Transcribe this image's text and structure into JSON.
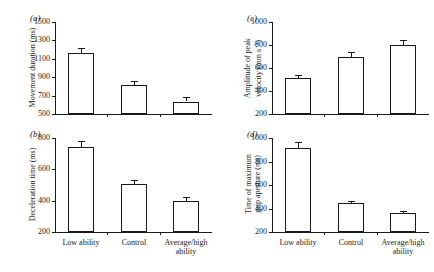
{
  "figure": {
    "background_color": "#ffffff",
    "line_color": "#1a1a1a",
    "bar_fill_color": "#ffffff"
  },
  "categories": [
    "Low ability",
    "Control",
    "Average/high ability"
  ],
  "category_labels": {
    "low": "Low ability",
    "control": "Control",
    "avg_high_line1": "Average/high",
    "avg_high_line2": "ability"
  },
  "panels": {
    "a": {
      "letter": "(a)",
      "ylabel": "Movement duration (ms)",
      "yticks": [
        "1500",
        "1300",
        "1100",
        "900",
        "700",
        "500"
      ]
    },
    "b": {
      "letter": "(b)",
      "ylabel": "Deceleration time (ms)",
      "yticks": [
        "800",
        "600",
        "400",
        "200"
      ]
    },
    "c": {
      "letter": "(c)",
      "ylabel_line1": "Amplitude of peak",
      "ylabel_line2": "velocity (mm s",
      "ylabel_sup": "−1",
      "ylabel_close": ")",
      "yticks": [
        "1000",
        "800",
        "600",
        "400",
        "200"
      ]
    },
    "d": {
      "letter": "(d)",
      "ylabel_line1": "Time of maximum",
      "ylabel_line2": "grip aperture (ms)",
      "yticks": [
        "1000",
        "800",
        "600",
        "400",
        "200"
      ]
    }
  },
  "chart_data": [
    {
      "type": "bar",
      "panel": "a",
      "title": "(a) Movement duration",
      "xlabel": "",
      "ylabel": "Movement duration (ms)",
      "categories": [
        "Low ability",
        "Control",
        "Average/high ability"
      ],
      "values": [
        1160,
        815,
        635
      ],
      "errors": [
        55,
        45,
        45
      ],
      "ylim": [
        500,
        1500
      ],
      "ytick_values": [
        500,
        700,
        900,
        1100,
        1300,
        1500
      ],
      "grid": false,
      "legend": "none"
    },
    {
      "type": "bar",
      "panel": "b",
      "title": "(b) Deceleration time",
      "xlabel": "",
      "ylabel": "Deceleration time (ms)",
      "categories": [
        "Low ability",
        "Control",
        "Average/high ability"
      ],
      "values": [
        740,
        505,
        400
      ],
      "errors": [
        40,
        25,
        25
      ],
      "ylim": [
        200,
        800
      ],
      "ytick_values": [
        200,
        400,
        600,
        800
      ],
      "grid": false,
      "legend": "none"
    },
    {
      "type": "bar",
      "panel": "c",
      "title": "(c) Amplitude of peak velocity",
      "xlabel": "",
      "ylabel": "Amplitude of peak velocity (mm s−1)",
      "categories": [
        "Low ability",
        "Control",
        "Average/high ability"
      ],
      "values": [
        512,
        695,
        800
      ],
      "errors": [
        30,
        45,
        45
      ],
      "ylim": [
        200,
        1000
      ],
      "ytick_values": [
        200,
        400,
        600,
        800,
        1000
      ],
      "grid": false,
      "legend": "none"
    },
    {
      "type": "bar",
      "panel": "d",
      "title": "(d) Time of maximum grip aperture",
      "xlabel": "",
      "ylabel": "Time of maximum grip aperture (ms)",
      "categories": [
        "Low ability",
        "Control",
        "Average/high ability"
      ],
      "values": [
        915,
        443,
        360
      ],
      "errors": [
        50,
        22,
        18
      ],
      "ylim": [
        200,
        1000
      ],
      "ytick_values": [
        200,
        400,
        600,
        800,
        1000
      ],
      "grid": false,
      "legend": "none"
    }
  ]
}
